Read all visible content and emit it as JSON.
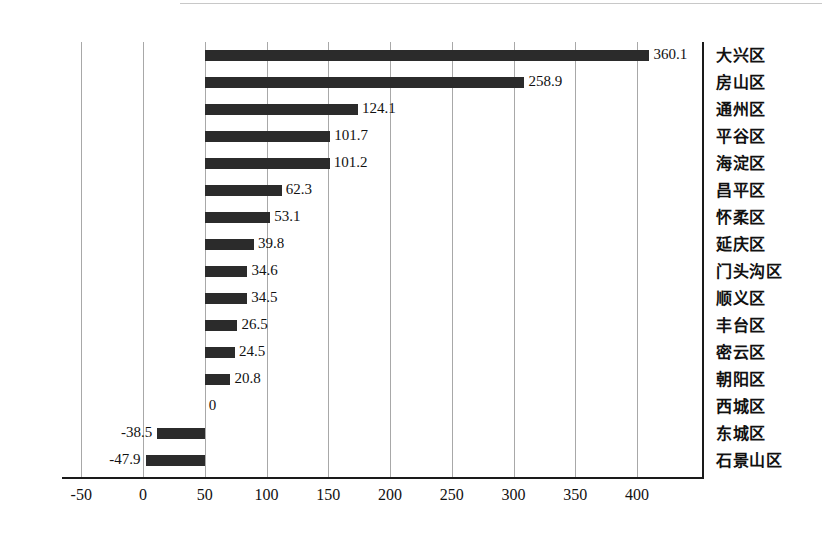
{
  "chart_data": {
    "type": "bar",
    "orientation": "horizontal",
    "title": "",
    "xlabel": "",
    "ylabel": "",
    "xlim": [
      -50,
      440
    ],
    "xticks": [
      -50,
      0,
      50,
      100,
      150,
      200,
      250,
      300,
      350,
      400
    ],
    "xtick_labels": [
      "-50",
      "0",
      "50",
      "100",
      "150",
      "200",
      "250",
      "300",
      "350",
      "400"
    ],
    "grid": "vertical",
    "legend": "none",
    "bar_baseline": 50,
    "bar_color": "#2b2b2b",
    "categories": [
      "大兴区",
      "房山区",
      "通州区",
      "平谷区",
      "海淀区",
      "昌平区",
      "怀柔区",
      "延庆区",
      "门头沟区",
      "顺义区",
      "丰台区",
      "密云区",
      "朝阳区",
      "西城区",
      "东城区",
      "石景山区"
    ],
    "values": [
      360.1,
      258.9,
      124.1,
      101.7,
      101.2,
      62.3,
      53.1,
      39.8,
      34.6,
      34.5,
      26.5,
      24.5,
      20.8,
      0,
      -38.5,
      -47.9
    ],
    "value_labels": [
      "360.1",
      "258.9",
      "124.1",
      "101.7",
      "101.2",
      "62.3",
      "53.1",
      "39.8",
      "34.6",
      "34.5",
      "26.5",
      "24.5",
      "20.8",
      "0",
      "-38.5",
      "-47.9"
    ]
  }
}
